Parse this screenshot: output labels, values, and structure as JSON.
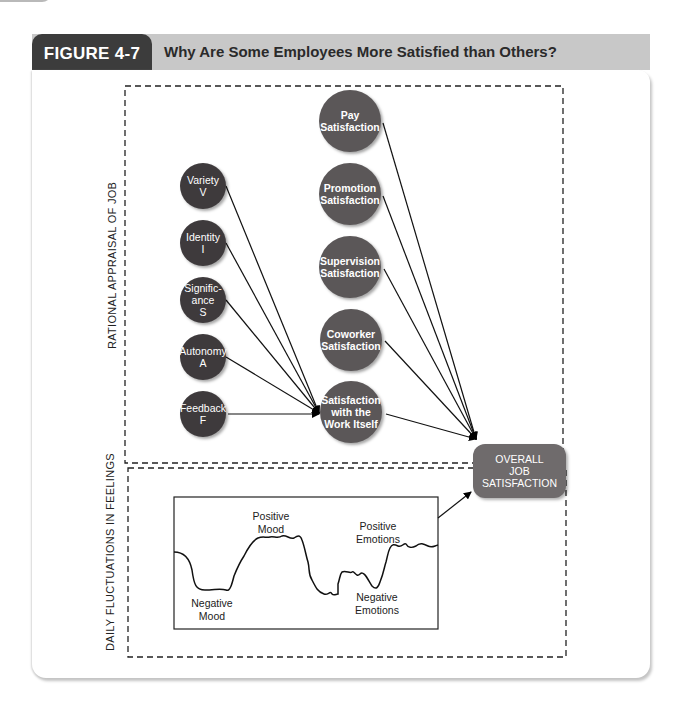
{
  "figure": {
    "number_label": "FIGURE 4-7",
    "title": "Why Are Some Employees More Satisfied than Others?"
  },
  "sections": {
    "rational": "RATIONAL APPRAISAL OF JOB",
    "daily": "DAILY FLUCTUATIONS IN FEELINGS"
  },
  "job_characteristics": [
    {
      "name": "Variety",
      "letter": "V"
    },
    {
      "name": "Identity",
      "letter": "I"
    },
    {
      "name": "Signific-\nance",
      "letter": "S"
    },
    {
      "name": "Autonomy",
      "letter": "A"
    },
    {
      "name": "Feedback",
      "letter": "F"
    }
  ],
  "satisfaction_facets": [
    {
      "label": "Pay Satisfaction"
    },
    {
      "label": "Promotion Satisfaction"
    },
    {
      "label": "Supervision Satisfaction"
    },
    {
      "label": "Coworker Satisfaction"
    },
    {
      "label": "Satisfaction with the Work Itself"
    }
  ],
  "outcome": {
    "line1": "OVERALL",
    "line2": "JOB",
    "line3": "SATISFACTION"
  },
  "wave_labels": {
    "positive_mood_1": "Positive",
    "positive_mood_2": "Mood",
    "negative_mood_1": "Negative",
    "negative_mood_2": "Mood",
    "positive_emotions_1": "Positive",
    "positive_emotions_2": "Emotions",
    "negative_emotions_1": "Negative",
    "negative_emotions_2": "Emotions"
  },
  "colors": {
    "header_dark": "#3c3c3c",
    "header_light": "#c8c8c8",
    "small_node": "#3e3a3c",
    "big_node": "#5b5758",
    "overall_node": "#6f6b6c"
  }
}
